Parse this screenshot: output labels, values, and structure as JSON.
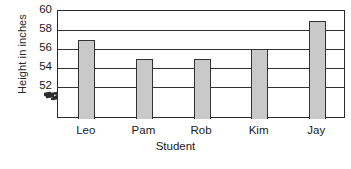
{
  "chart_data": {
    "type": "bar",
    "title": "",
    "xlabel": "Student",
    "ylabel": "Height in inches",
    "categories": [
      "Leo",
      "Pam",
      "Rob",
      "Kim",
      "Jay"
    ],
    "values": [
      57,
      55,
      55,
      56,
      59
    ],
    "ylim": [
      52,
      60
    ],
    "ytick_labels": [
      "52",
      "54",
      "56",
      "58",
      "60"
    ],
    "ytick_values": [
      52,
      54,
      56,
      58,
      60
    ],
    "ytick_step": 2,
    "grid": "horizontal",
    "legend": "none",
    "axis_break": {
      "present": true,
      "axis": "y",
      "below_value": 52,
      "symbol": "zigzag"
    },
    "colors": {
      "bar_fill": "#c9c9c9",
      "bar_border": "#333333",
      "grid": "#333333",
      "axis": "#2b2b2b",
      "text": "#1a1a1a",
      "background": "#ffffff"
    }
  },
  "footer": {
    "clipped_text": ""
  }
}
